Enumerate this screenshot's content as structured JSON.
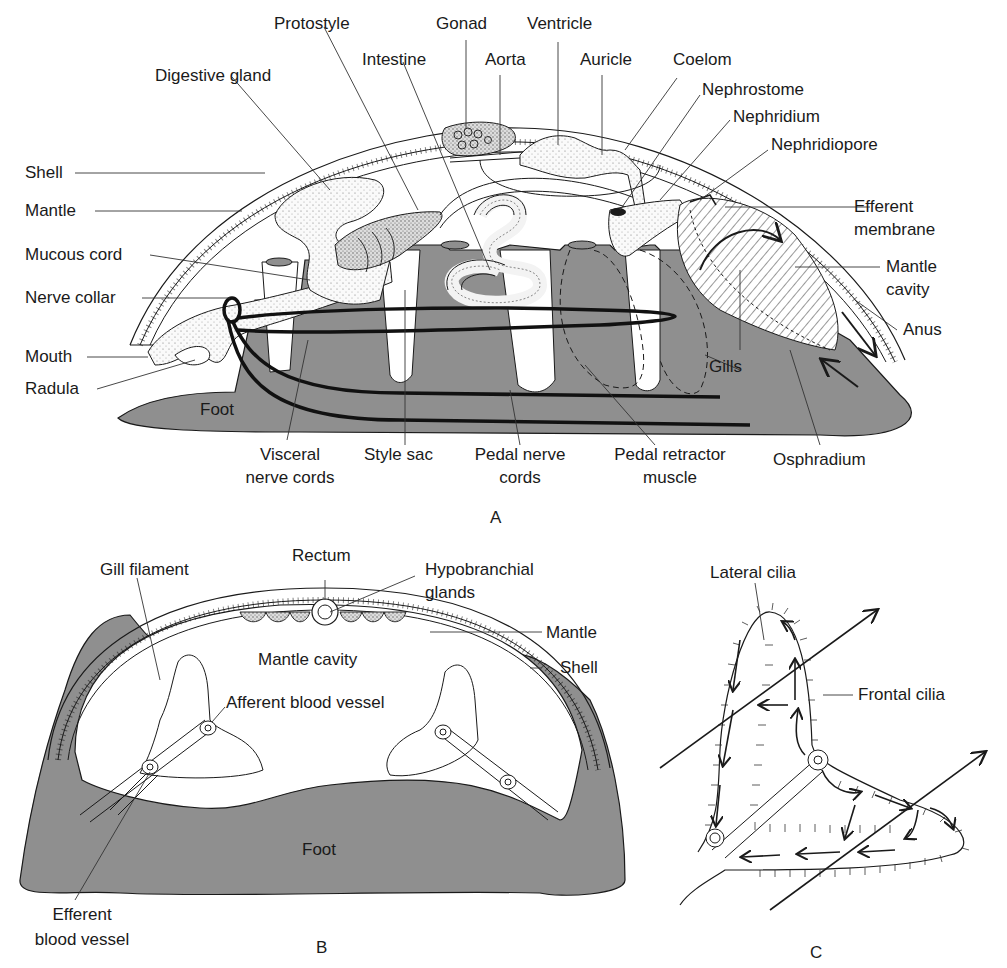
{
  "figure": {
    "colors": {
      "foot_fill": "#8f8f8f",
      "line": "#1a1a1a",
      "stipple": "#f3f3f3",
      "background": "#ffffff"
    },
    "panels": [
      {
        "id": "A",
        "letter": "A",
        "labels": {
          "protostyle": "Protostyle",
          "gonad": "Gonad",
          "ventricle": "Ventricle",
          "digestive_gland": "Digestive gland",
          "intestine": "Intestine",
          "aorta": "Aorta",
          "auricle": "Auricle",
          "coelom": "Coelom",
          "nephrostome": "Nephrostome",
          "nephridium": "Nephridium",
          "nephridiopore": "Nephridiopore",
          "shell": "Shell",
          "mantle": "Mantle",
          "efferent_membrane_1": "Efferent",
          "efferent_membrane_2": "membrane",
          "mucous_cord": "Mucous cord",
          "mantle_cavity_1": "Mantle",
          "mantle_cavity_2": "cavity",
          "nerve_collar": "Nerve collar",
          "anus": "Anus",
          "mouth": "Mouth",
          "gills": "Gills",
          "radula": "Radula",
          "foot": "Foot",
          "visceral_nerve_cords_1": "Visceral",
          "visceral_nerve_cords_2": "nerve cords",
          "style_sac": "Style sac",
          "pedal_nerve_cords_1": "Pedal nerve",
          "pedal_nerve_cords_2": "cords",
          "pedal_retractor_muscle_1": "Pedal retractor",
          "pedal_retractor_muscle_2": "muscle",
          "osphradium": "Osphradium"
        }
      },
      {
        "id": "B",
        "letter": "B",
        "labels": {
          "rectum": "Rectum",
          "gill_filament": "Gill filament",
          "hypobranchial_glands_1": "Hypobranchial",
          "hypobranchial_glands_2": "glands",
          "mantle": "Mantle",
          "mantle_cavity": "Mantle cavity",
          "shell": "Shell",
          "afferent_blood_vessel": "Afferent blood vessel",
          "foot": "Foot",
          "efferent_blood_vessel_1": "Efferent",
          "efferent_blood_vessel_2": "blood vessel"
        }
      },
      {
        "id": "C",
        "letter": "C",
        "labels": {
          "lateral_cilia": "Lateral cilia",
          "frontal_cilia": "Frontal cilia"
        }
      }
    ]
  }
}
